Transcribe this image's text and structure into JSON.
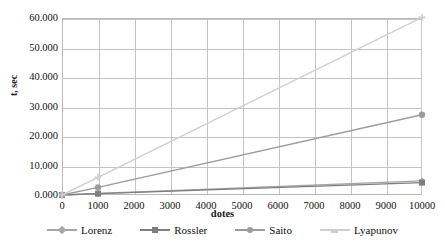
{
  "chart_data": {
    "type": "line",
    "title": "",
    "xlabel": "dotes",
    "ylabel": "t, sec",
    "x": [
      0,
      1000,
      10000
    ],
    "xlim": [
      0,
      10000
    ],
    "ylim": [
      0,
      60
    ],
    "xticks": [
      "0",
      "1000",
      "2000",
      "3000",
      "4000",
      "5000",
      "6000",
      "7000",
      "8000",
      "9000",
      "10000"
    ],
    "xtick_values": [
      0,
      1000,
      2000,
      3000,
      4000,
      5000,
      6000,
      7000,
      8000,
      9000,
      10000
    ],
    "yticks": [
      "0.000",
      "10.000",
      "20.000",
      "30.000",
      "40.000",
      "50.000",
      "60.000"
    ],
    "ytick_values": [
      0,
      10,
      20,
      30,
      40,
      50,
      60
    ],
    "grid": true,
    "legend_position": "bottom",
    "series": [
      {
        "name": "Lorenz",
        "color": "#a6a6a6",
        "marker": "diamond",
        "values": [
          0.0,
          0.5,
          4.8
        ]
      },
      {
        "name": "Rossler",
        "color": "#7f7f7f",
        "marker": "square",
        "values": [
          0.0,
          0.45,
          4.2
        ]
      },
      {
        "name": "Saito",
        "color": "#9c9c9c",
        "marker": "circle",
        "values": [
          0.0,
          2.6,
          27.2
        ]
      },
      {
        "name": "Lyapunov",
        "color": "#cfcfcf",
        "marker": "cross",
        "values": [
          0.0,
          6.0,
          60.2
        ]
      }
    ]
  }
}
